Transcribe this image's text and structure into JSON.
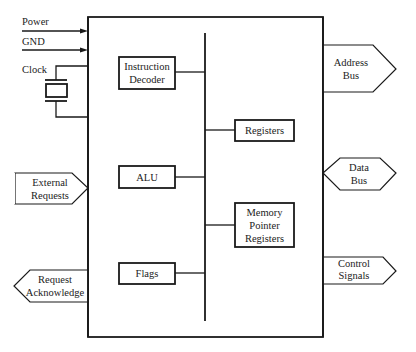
{
  "diagram": {
    "inputs": {
      "power": "Power",
      "gnd": "GND",
      "clock": "Clock"
    },
    "internal_blocks": {
      "instruction_decoder": [
        "Instruction",
        "Decoder"
      ],
      "registers": [
        "Registers"
      ],
      "alu": [
        "ALU"
      ],
      "memory_pointer_registers": [
        "Memory",
        "Pointer",
        "Registers"
      ],
      "flags": [
        "Flags"
      ]
    },
    "external_signals": {
      "address_bus": [
        "Address",
        "Bus"
      ],
      "data_bus": [
        "Data",
        "Bus"
      ],
      "control_signals": [
        "Control",
        "Signals"
      ],
      "external_requests": [
        "External",
        "Requests"
      ],
      "request_acknowledge": [
        "Request",
        "Acknowledge"
      ]
    },
    "signal_directions": {
      "address_bus": "output",
      "data_bus": "bidirectional",
      "control_signals": "output",
      "external_requests": "input",
      "request_acknowledge": "output",
      "power": "input",
      "gnd": "input"
    }
  }
}
